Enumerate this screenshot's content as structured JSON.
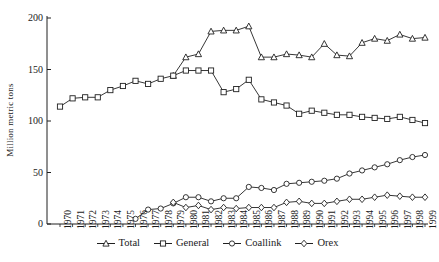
{
  "chart_data": {
    "type": "line",
    "title": "",
    "xlabel": "",
    "ylabel": "Million metric tons",
    "ylim": [
      0,
      200
    ],
    "yticks": [
      0,
      50,
      100,
      150,
      200
    ],
    "grid": false,
    "legend_position": "bottom",
    "x": [
      "1970",
      "1971",
      "1972",
      "1973",
      "1974",
      "1975",
      "1976",
      "1977",
      "1978",
      "1979",
      "1980",
      "1981",
      "1982",
      "1983",
      "1984",
      "1985",
      "1986",
      "1987",
      "1988",
      "1989",
      "1990",
      "1991",
      "1992",
      "1993",
      "1994",
      "1995",
      "1996",
      "1997",
      "1998",
      "1999"
    ],
    "series": [
      {
        "name": "Total",
        "marker": "triangle",
        "values": [
          null,
          null,
          null,
          null,
          null,
          null,
          null,
          null,
          null,
          144,
          162,
          165,
          187,
          188,
          188,
          192,
          162,
          162,
          165,
          164,
          162,
          175,
          164,
          163,
          176,
          180,
          178,
          184,
          180,
          181
        ]
      },
      {
        "name": "General",
        "marker": "square",
        "values": [
          114,
          122,
          123,
          123,
          130,
          134,
          139,
          136,
          141,
          144,
          149,
          149,
          149,
          128,
          131,
          140,
          121,
          118,
          115,
          107,
          110,
          108,
          106,
          106,
          104,
          103,
          102,
          104,
          101,
          98
        ]
      },
      {
        "name": "Coallink",
        "marker": "circle",
        "values": [
          null,
          null,
          null,
          null,
          null,
          null,
          5,
          14,
          15,
          20,
          26,
          26,
          22,
          25,
          25,
          36,
          35,
          33,
          39,
          40,
          41,
          42,
          44,
          49,
          52,
          55,
          58,
          62,
          65,
          67
        ]
      },
      {
        "name": "Orex",
        "marker": "diamond",
        "values": [
          null,
          null,
          null,
          null,
          null,
          null,
          null,
          null,
          null,
          21,
          16,
          18,
          14,
          16,
          15,
          16,
          16,
          16,
          21,
          22,
          20,
          20,
          22,
          24,
          24,
          26,
          28,
          27,
          26,
          26
        ]
      }
    ]
  },
  "axes": {
    "ytick_labels": [
      "200",
      "150",
      "100",
      "50",
      "0"
    ]
  },
  "legend": {
    "items": [
      {
        "label": "Total",
        "marker": "triangle"
      },
      {
        "label": "General",
        "marker": "square"
      },
      {
        "label": "Coallink",
        "marker": "circle"
      },
      {
        "label": "Orex",
        "marker": "diamond"
      }
    ]
  },
  "style": {
    "line_color": "#202020",
    "marker_fill": "#ffffff",
    "axis_color": "#202020"
  }
}
